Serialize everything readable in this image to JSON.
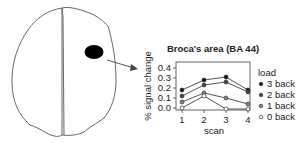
{
  "figure": {
    "region_label": "Broca's area (BA 44)",
    "colors": {
      "outline": "#555555",
      "activation_blob": "#000000",
      "arrow": "#444444",
      "line": "#555555"
    }
  },
  "chart_data": {
    "type": "line",
    "title": "Broca's area (BA 44)",
    "xlabel": "scan",
    "ylabel": "% signal change",
    "x": [
      1,
      2,
      3,
      4
    ],
    "xticks": [
      "1",
      "2",
      "3",
      "4"
    ],
    "yticks": [
      "0.0",
      "0.1",
      "0.2",
      "0.3",
      "0.4"
    ],
    "ylim": [
      0.0,
      0.4
    ],
    "grid": false,
    "legend": {
      "title": "load",
      "placement": "right"
    },
    "series": [
      {
        "name": "3 back",
        "values": [
          0.18,
          0.28,
          0.31,
          0.18
        ],
        "marker_fill": "#111111"
      },
      {
        "name": "2 back",
        "values": [
          0.12,
          0.23,
          0.26,
          0.16
        ],
        "marker_fill": "#444444"
      },
      {
        "name": "1 back",
        "values": [
          0.06,
          0.15,
          0.1,
          0.04
        ],
        "marker_fill": "#888888"
      },
      {
        "name": "0 back",
        "values": [
          0.0,
          0.12,
          -0.01,
          -0.01
        ],
        "marker_fill": "#ffffff"
      }
    ]
  }
}
